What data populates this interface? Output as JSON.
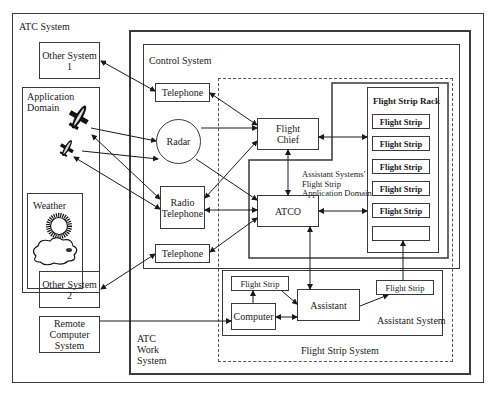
{
  "diagram": {
    "atc_system": {
      "label": "ATC System"
    },
    "other_system_1": {
      "label": "Other System 1"
    },
    "other_system_2": {
      "label": "Other System 2"
    },
    "remote_computer_system": {
      "label": "Remote\nComputer\nSystem"
    },
    "application_domain": {
      "label": "Application\nDomain"
    },
    "weather": {
      "label": "Weather"
    },
    "atc_work_system": {
      "label": "ATC\nWork\nSystem"
    },
    "control_system": {
      "label": "Control System"
    },
    "telephone_top": {
      "label": "Telephone"
    },
    "telephone_bottom": {
      "label": "Telephone"
    },
    "radar": {
      "label": "Radar"
    },
    "radio_telephone": {
      "label": "Radio\nTelephone"
    },
    "flight_chief": {
      "label": "Flight\nChief"
    },
    "atco": {
      "label": "ATCO"
    },
    "assistant_domain": {
      "label": "Assistant Systems'\nFlight Strip\nApplication Domain"
    },
    "flight_strip_rack": {
      "label": "Flight Strip Rack",
      "strips": [
        "Flight Strip",
        "Flight Strip",
        "Flight Strip",
        "Flight Strip",
        "Flight Strip",
        ""
      ]
    },
    "assistant_system": {
      "label": "Assistant System",
      "flight_strip_left": "Flight Strip",
      "flight_strip_right": "Flight Strip",
      "computer": "Computer",
      "assistant": "Assistant"
    },
    "flight_strip_system": {
      "label": "Flight Strip System"
    },
    "colors": {
      "line": "#3a3a3a",
      "background": "#ffffff"
    }
  }
}
